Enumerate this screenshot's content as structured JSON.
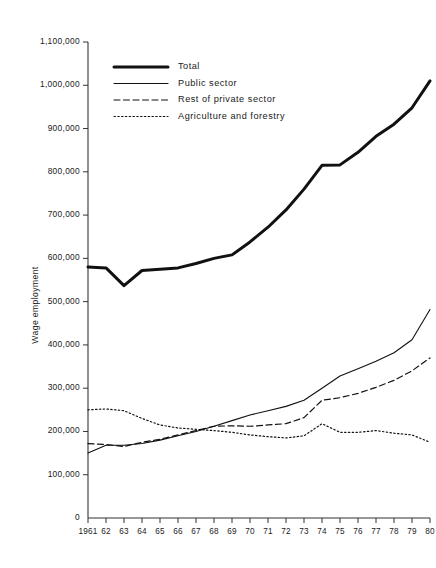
{
  "chart_data": {
    "type": "line",
    "title": "",
    "xlabel": "",
    "ylabel": "Wage employment",
    "x": [
      1961,
      1962,
      1963,
      1964,
      1965,
      1966,
      1967,
      1968,
      1969,
      1970,
      1971,
      1972,
      1973,
      1974,
      1975,
      1976,
      1977,
      1978,
      1979,
      1980
    ],
    "xtick_labels": [
      "1961",
      "62",
      "63",
      "64",
      "65",
      "66",
      "67",
      "68",
      "69",
      "70",
      "71",
      "72",
      "73",
      "74",
      "75",
      "76",
      "77",
      "78",
      "79",
      "80"
    ],
    "ytick_labels": [
      "0",
      "100,000",
      "200,000",
      "300,000",
      "400,000",
      "500,000",
      "600,000",
      "700,000",
      "800,000",
      "900,000",
      "1,000,000",
      "1,100,000"
    ],
    "ytick_values": [
      0,
      100000,
      200000,
      300000,
      400000,
      500000,
      600000,
      700000,
      800000,
      900000,
      1000000,
      1100000
    ],
    "ylim": [
      0,
      1100000
    ],
    "xlim": [
      1961,
      1980
    ],
    "grid": false,
    "legend_position": "upper-left-inside",
    "series": [
      {
        "name": "Total",
        "style": "solid-thick",
        "values": [
          580000,
          578000,
          537000,
          572000,
          575000,
          578000,
          588000,
          600000,
          608000,
          638000,
          672000,
          712000,
          760000,
          815000,
          816000,
          845000,
          882000,
          910000,
          948000,
          1010000
        ]
      },
      {
        "name": "Public sector",
        "style": "solid-thin",
        "values": [
          150000,
          168000,
          168000,
          172000,
          180000,
          190000,
          200000,
          212000,
          225000,
          238000,
          248000,
          258000,
          272000,
          300000,
          328000,
          345000,
          362000,
          382000,
          412000,
          482000
        ]
      },
      {
        "name": "Rest of private sector",
        "style": "dashed",
        "values": [
          172000,
          170000,
          165000,
          175000,
          182000,
          192000,
          202000,
          212000,
          213000,
          212000,
          215000,
          218000,
          232000,
          272000,
          278000,
          288000,
          302000,
          318000,
          340000,
          370000
        ]
      },
      {
        "name": "Agriculture and forestry",
        "style": "dotted",
        "values": [
          250000,
          252000,
          248000,
          230000,
          215000,
          208000,
          205000,
          202000,
          198000,
          192000,
          188000,
          185000,
          190000,
          218000,
          198000,
          198000,
          202000,
          196000,
          192000,
          175000
        ]
      }
    ]
  },
  "legend": {
    "items": [
      {
        "label": "Total",
        "style": "solid-thick"
      },
      {
        "label": "Public sector",
        "style": "solid-thin"
      },
      {
        "label": "Rest of private sector",
        "style": "dashed"
      },
      {
        "label": "Agriculture and forestry",
        "style": "dotted"
      }
    ]
  },
  "axes": {
    "y_title": "Wage employment",
    "origin_label": "0"
  },
  "colors": {
    "line": "#111111",
    "axis": "#333333",
    "background": "#ffffff"
  }
}
